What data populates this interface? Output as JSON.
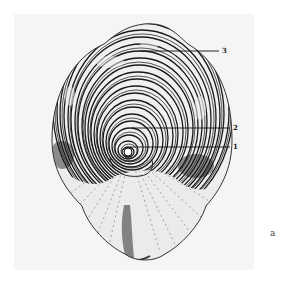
{
  "figure": {
    "labels": [
      {
        "id": "3",
        "text": "3"
      },
      {
        "id": "2",
        "text": "2"
      },
      {
        "id": "1",
        "text": "1"
      }
    ],
    "figure_letter": "a",
    "colors": {
      "ink": "#1a1a1a",
      "paper": "#f5f5f5",
      "background": "#ffffff"
    }
  }
}
